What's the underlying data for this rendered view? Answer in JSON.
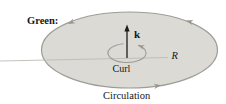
{
  "figure": {
    "heading": "Green:",
    "labels": {
      "k_vector": "k",
      "curl": "Curl",
      "radius": "R",
      "circulation": "Circulation"
    },
    "colors": {
      "region_fill": "#dbdad4",
      "region_outline": "#9c9c98",
      "arrowhead": "#9a958d",
      "axis_line": "#bcbcb5",
      "vector_color": "#1c1c1c"
    }
  }
}
